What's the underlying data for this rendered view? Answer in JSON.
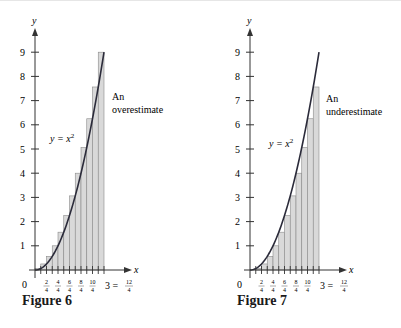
{
  "figures": [
    {
      "caption": "Figure 6",
      "annotation_line1": "An",
      "annotation_line2": "overestimate",
      "curve_label": "y = x",
      "curve_exp": "2",
      "method": "right"
    },
    {
      "caption": "Figure 7",
      "annotation_line1": "An",
      "annotation_line2": "underestimate",
      "curve_label": "y = x",
      "curve_exp": "2",
      "method": "left"
    }
  ],
  "axis": {
    "x_label": "x",
    "y_label": "y",
    "origin_label": "0",
    "y_ticks": [
      "1",
      "2",
      "3",
      "4",
      "5",
      "6",
      "7",
      "8",
      "9"
    ],
    "x_tick_numerators": [
      "2",
      "4",
      "6",
      "8",
      "10"
    ],
    "x_tick_denominator": "4",
    "x_end_label": "3 =",
    "x_end_numerator": "12",
    "x_end_denominator": "4"
  },
  "colors": {
    "bar_fill": "#d9d9d9",
    "bar_stroke": "#8a8a8a",
    "curve": "#2b2b3a",
    "axis": "#333333"
  },
  "chart_data": [
    {
      "type": "bar",
      "title": "Figure 6",
      "annotation": "An overestimate",
      "function": "y = x^2",
      "interval": [
        0,
        3
      ],
      "n": 12,
      "method": "right endpoints",
      "x_left": [
        0,
        0.25,
        0.5,
        0.75,
        1,
        1.25,
        1.5,
        1.75,
        2,
        2.25,
        2.5,
        2.75
      ],
      "values": [
        0.0625,
        0.25,
        0.5625,
        1,
        1.5625,
        2.25,
        3.0625,
        4,
        5.0625,
        6.25,
        7.5625,
        9
      ],
      "xlabel": "x",
      "ylabel": "y",
      "ylim": [
        0,
        9.8
      ],
      "xlim": [
        0,
        3
      ]
    },
    {
      "type": "bar",
      "title": "Figure 7",
      "annotation": "An underestimate",
      "function": "y = x^2",
      "interval": [
        0,
        3
      ],
      "n": 12,
      "method": "left endpoints",
      "x_left": [
        0,
        0.25,
        0.5,
        0.75,
        1,
        1.25,
        1.5,
        1.75,
        2,
        2.25,
        2.5,
        2.75
      ],
      "values": [
        0,
        0.0625,
        0.25,
        0.5625,
        1,
        1.5625,
        2.25,
        3.0625,
        4,
        5.0625,
        6.25,
        7.5625
      ],
      "xlabel": "x",
      "ylabel": "y",
      "ylim": [
        0,
        9.8
      ],
      "xlim": [
        0,
        3
      ]
    }
  ]
}
